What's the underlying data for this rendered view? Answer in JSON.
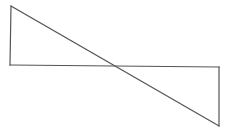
{
  "diagram": {
    "width": 231,
    "height": 135,
    "background": "#ffffff",
    "stroke_color": "#555555",
    "stroke_width": 1.2,
    "shapes": [
      {
        "name": "left-triangle",
        "points": [
          [
            11,
            6
          ],
          [
            10,
            65
          ],
          [
            116,
            66
          ]
        ]
      },
      {
        "name": "right-triangle",
        "points": [
          [
            116,
            66
          ],
          [
            219,
            67
          ],
          [
            219,
            126
          ]
        ]
      }
    ],
    "lines": [
      {
        "name": "horizontal-line",
        "from": [
          10,
          65
        ],
        "to": [
          219,
          67
        ]
      },
      {
        "name": "diagonal-line",
        "from": [
          11,
          6
        ],
        "to": [
          219,
          126
        ]
      },
      {
        "name": "left-vertical-line",
        "from": [
          11,
          6
        ],
        "to": [
          10,
          65
        ]
      },
      {
        "name": "right-vertical-line",
        "from": [
          219,
          67
        ],
        "to": [
          219,
          126
        ]
      }
    ],
    "intersection": [
      116,
      66
    ]
  }
}
